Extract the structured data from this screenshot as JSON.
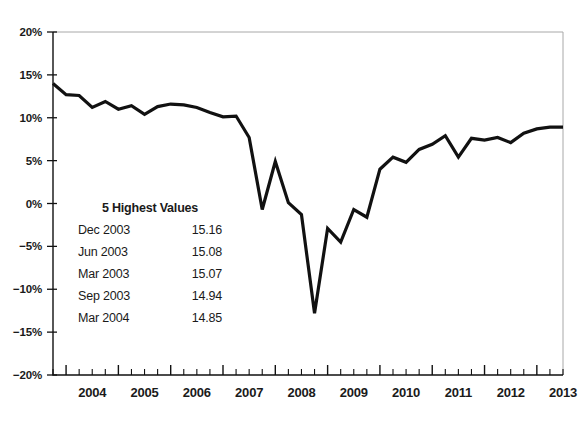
{
  "chart_data": {
    "type": "line",
    "title": "",
    "subtitle": "",
    "xlabel": "",
    "ylabel": "",
    "ylim": [
      -20,
      20
    ],
    "xlim": [
      2003.75,
      2013.5
    ],
    "grid": false,
    "legend_position": "none",
    "axis": {
      "y_ticks": [
        20,
        15,
        10,
        5,
        0,
        -5,
        -10,
        -15,
        -20
      ],
      "y_tick_labels": [
        "20%",
        "15%",
        "10%",
        "5%",
        "0%",
        "−5%",
        "−10%",
        "−15%",
        "−20%"
      ],
      "x_ticks": [
        2004,
        2005,
        2006,
        2007,
        2008,
        2009,
        2010,
        2011,
        2012,
        2013
      ],
      "x_tick_labels": [
        "2004",
        "2005",
        "2006",
        "2007",
        "2008",
        "2009",
        "2010",
        "2011",
        "2012",
        "2013"
      ],
      "x_minor_ticks_per_year": 4
    },
    "series": [
      {
        "name": "value",
        "color": "#111111",
        "line_width": 3.2,
        "x": [
          2003.75,
          2004.0,
          2004.25,
          2004.5,
          2004.75,
          2005.0,
          2005.25,
          2005.5,
          2005.75,
          2006.0,
          2006.25,
          2006.5,
          2006.75,
          2007.0,
          2007.25,
          2007.5,
          2007.75,
          2008.0,
          2008.25,
          2008.5,
          2008.75,
          2009.0,
          2009.25,
          2009.5,
          2009.75,
          2010.0,
          2010.25,
          2010.5,
          2010.75,
          2011.0,
          2011.25,
          2011.5,
          2011.75,
          2012.0,
          2012.25,
          2012.5,
          2012.75,
          2013.0,
          2013.25,
          2013.5
        ],
        "y": [
          14.0,
          12.7,
          12.6,
          11.2,
          11.9,
          11.0,
          11.4,
          10.4,
          11.3,
          11.6,
          11.5,
          11.2,
          10.6,
          10.1,
          10.2,
          7.7,
          -0.7,
          4.9,
          0.1,
          -1.3,
          -12.8,
          -2.9,
          -4.5,
          -0.7,
          -1.6,
          4.0,
          5.4,
          4.8,
          6.3,
          6.9,
          7.9,
          5.4,
          7.6,
          7.4,
          7.7,
          7.1,
          8.2,
          8.7,
          8.9,
          8.9
        ]
      }
    ],
    "annotation": {
      "title": "5 Highest Values",
      "rows": [
        {
          "label": "Dec 2003",
          "value": "15.16"
        },
        {
          "label": "Jun 2003",
          "value": "15.08"
        },
        {
          "label": "Mar 2003",
          "value": "15.07"
        },
        {
          "label": "Sep 2003",
          "value": "14.94"
        },
        {
          "label": "Mar 2004",
          "value": "14.85"
        }
      ]
    },
    "colors": {
      "line": "#111111",
      "axis": "#111111",
      "frame": "#a8a8a8",
      "background": "#ffffff",
      "text": "#1a1a1a"
    }
  }
}
